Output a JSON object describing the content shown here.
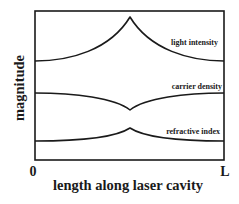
{
  "diagram": {
    "title": "",
    "x_axis": {
      "label": "length along laser cavity",
      "start_label": "0",
      "end_label": "L"
    },
    "y_axis": {
      "label": "magnitude"
    },
    "curves": [
      {
        "id": "light-intensity",
        "label": "light intensity",
        "shape": "cusp-peak-at-center"
      },
      {
        "id": "carrier-density",
        "label": "carrier density",
        "shape": "cusp-dip-at-center"
      },
      {
        "id": "refractive-index",
        "label": "refractive index",
        "shape": "small-cusp-peak-at-center"
      }
    ],
    "colors": {
      "line": "#1a1a1a",
      "background": "#ffffff"
    }
  }
}
